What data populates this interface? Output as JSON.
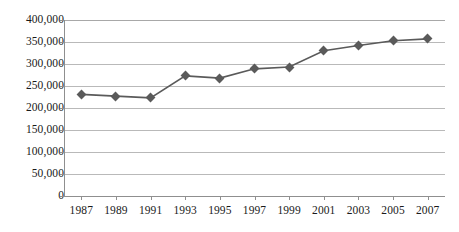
{
  "chart_data": {
    "type": "line",
    "title": "",
    "subtitle": "",
    "xlabel": "",
    "ylabel": "",
    "categories": [
      "1987",
      "1989",
      "1991",
      "1993",
      "1995",
      "1997",
      "1999",
      "2001",
      "2003",
      "2005",
      "2007"
    ],
    "x": [
      1987,
      1989,
      1991,
      1993,
      1995,
      1997,
      1999,
      2001,
      2003,
      2005,
      2007
    ],
    "values": [
      231000,
      227000,
      223000,
      273000,
      268000,
      289000,
      293000,
      330000,
      342000,
      353000,
      357000
    ],
    "series": [
      {
        "name": "",
        "values": [
          231000,
          227000,
          223000,
          273000,
          268000,
          289000,
          293000,
          330000,
          342000,
          353000,
          357000
        ]
      }
    ],
    "ylim": [
      0,
      400000
    ],
    "ytick_values": [
      0,
      50000,
      100000,
      150000,
      200000,
      250000,
      300000,
      350000,
      400000
    ],
    "ytick_labels": [
      "0",
      "50,000",
      "100,000",
      "150,000",
      "200,000",
      "250,000",
      "300,000",
      "350,000",
      "400,000"
    ],
    "xlim": [
      1986,
      2008
    ],
    "grid": "horizontal",
    "legend": "none",
    "marker": "diamond",
    "colors": {
      "line": "#5a5a5a",
      "marker": "#5a5a5a",
      "grid": "#b9b9b9",
      "axis": "#8f8f8f",
      "text": "#1a1a1a",
      "background": "#ffffff"
    }
  }
}
